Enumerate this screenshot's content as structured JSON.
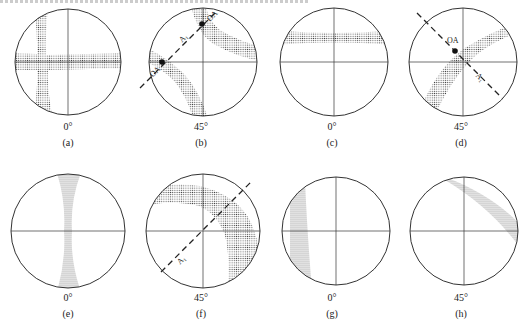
{
  "figure": {
    "panels": [
      {
        "id": "a",
        "caption": "(a)",
        "angle": "0°",
        "cx": 68,
        "cy": 62,
        "r": 53
      },
      {
        "id": "b",
        "caption": "(b)",
        "angle": "45°",
        "cx": 203,
        "cy": 62,
        "r": 54,
        "labels": [
          "OA",
          "OA",
          "A₁"
        ]
      },
      {
        "id": "c",
        "caption": "(c)",
        "angle": "0°",
        "cx": 334,
        "cy": 62,
        "r": 54
      },
      {
        "id": "d",
        "caption": "(d)",
        "angle": "45°",
        "cx": 463,
        "cy": 62,
        "r": 54,
        "labels": [
          "OA",
          "A₁"
        ]
      },
      {
        "id": "e",
        "caption": "(e)",
        "angle": "0°",
        "cx": 68,
        "cy": 231,
        "r": 57
      },
      {
        "id": "f",
        "caption": "(f)",
        "angle": "45°",
        "cx": 203,
        "cy": 231,
        "r": 57,
        "labels": [
          "A₁"
        ]
      },
      {
        "id": "g",
        "caption": "(g)",
        "angle": "0°",
        "cx": 336,
        "cy": 231,
        "r": 54
      },
      {
        "id": "h",
        "caption": "(h)",
        "angle": "45°",
        "cx": 464,
        "cy": 231,
        "r": 54
      }
    ],
    "colors": {
      "line": "#333333",
      "stipple": "#555555"
    }
  }
}
